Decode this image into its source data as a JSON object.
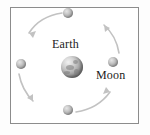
{
  "figure": {
    "frame": {
      "border_color": "#8c8c8c",
      "background_color": "#ffffff"
    }
  },
  "labels": {
    "earth": "Earth",
    "moon": "Moon"
  },
  "bodies": {
    "earth": {
      "name": "Earth",
      "center": {
        "x": 72,
        "y": 67
      },
      "radius": 11,
      "color": "#9d9d9d"
    },
    "moon_positions": [
      {
        "name": "moon-top",
        "center": {
          "x": 68,
          "y": 13
        },
        "radius": 5,
        "color": "#a6a6a6"
      },
      {
        "name": "moon-left",
        "center": {
          "x": 21,
          "y": 64
        },
        "radius": 5,
        "color": "#a6a6a6"
      },
      {
        "name": "moon-right",
        "center": {
          "x": 113,
          "y": 62
        },
        "radius": 5,
        "color": "#a6a6a6"
      },
      {
        "name": "moon-bottom",
        "center": {
          "x": 68,
          "y": 110
        },
        "radius": 5,
        "color": "#a6a6a6"
      }
    ]
  },
  "orbit": {
    "center": {
      "x": 70,
      "y": 63
    },
    "radius_x": 47,
    "radius_y": 48,
    "direction": "counterclockwise",
    "arrow_color": "#bdbdbd",
    "arrows": [
      {
        "name": "arrow-top-left",
        "from": "moon-top",
        "to": "moon-left",
        "points": "up-left then down-left"
      },
      {
        "name": "arrow-bottom-left",
        "from": "moon-left",
        "to": "moon-bottom",
        "points": "down"
      },
      {
        "name": "arrow-bottom-right",
        "from": "moon-bottom",
        "to": "moon-right",
        "points": "up-right"
      },
      {
        "name": "arrow-top-right",
        "from": "moon-right",
        "to": "moon-top",
        "points": "up-left"
      }
    ]
  }
}
